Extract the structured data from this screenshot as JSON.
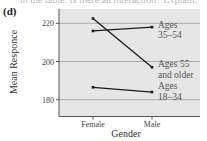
{
  "figure": {
    "panel_label": "(d)",
    "cut_off_text": "in the table. Is there an interaction? Explain."
  },
  "chart_data": {
    "type": "line",
    "title": "",
    "xlabel": "Gender",
    "ylabel": "Mean Responce",
    "categories": [
      "Female",
      "Male"
    ],
    "yticks": [
      180,
      200,
      220
    ],
    "ylim": [
      172,
      229
    ],
    "grid": "horizontal",
    "series": [
      {
        "name": "Ages 35–54",
        "label_lines": [
          "Ages",
          "35–54"
        ],
        "values": [
          216,
          218
        ]
      },
      {
        "name": "Ages 55 and older",
        "label_lines": [
          "Ages 55",
          "and older"
        ],
        "values": [
          222.5,
          197
        ]
      },
      {
        "name": "Ages 18–34",
        "label_lines": [
          "Ages",
          "18–34"
        ],
        "values": [
          186.5,
          184
        ]
      }
    ],
    "legend_position": "inline-right"
  },
  "colors": {
    "panel_bg": "#e6e6e6",
    "grid": "#a9a9a9",
    "line": "#1a1a1a",
    "axis": "#555555"
  }
}
